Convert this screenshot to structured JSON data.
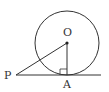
{
  "diagram": {
    "type": "geometry",
    "colors": {
      "stroke": "#333333",
      "background": "#ffffff"
    },
    "circle": {
      "center_label": "O",
      "cx": 67,
      "cy": 43,
      "r": 32
    },
    "points": [
      {
        "label": "O",
        "x": 67,
        "y": 43
      },
      {
        "label": "P",
        "x": 16,
        "y": 75
      },
      {
        "label": "A",
        "x": 67,
        "y": 75
      }
    ],
    "segments": [
      {
        "from": "P",
        "to": "O"
      },
      {
        "from": "O",
        "to": "A"
      },
      {
        "from": "P",
        "to": "tangent-end"
      }
    ],
    "right_angle_at": "A",
    "labels": {
      "O": "O",
      "P": "P",
      "A": "A"
    }
  }
}
